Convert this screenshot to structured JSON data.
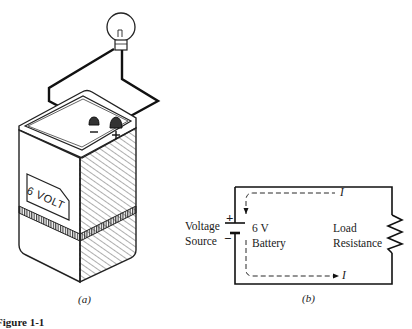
{
  "figure": {
    "panel_a": {
      "caption": "(a)",
      "battery_label": "6 VOLT",
      "terminal_negative": "−",
      "terminal_positive": "+"
    },
    "panel_b": {
      "caption": "(b)",
      "source_label_line1": "Voltage",
      "source_label_line2": "Source",
      "plus_sign": "+",
      "minus_sign": "−",
      "battery_label_line1": "6 V",
      "battery_label_line2": "Battery",
      "load_label_line1": "Load",
      "load_label_line2": "Resistance",
      "current_top": "I",
      "current_bottom": "I"
    },
    "figure_caption_fragment": "Figure 1-1"
  }
}
